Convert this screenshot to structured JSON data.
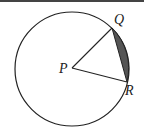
{
  "diagram": {
    "circle": {
      "cx": 72,
      "cy": 69,
      "r": 57,
      "stroke": "#222222"
    },
    "points": {
      "P": {
        "label": "P",
        "x": 72,
        "y": 68
      },
      "Q": {
        "label": "Q",
        "x": 112,
        "y": 28
      },
      "R": {
        "label": "R",
        "x": 127,
        "y": 82
      }
    },
    "segments": [
      "PQ",
      "PR",
      "QR"
    ],
    "shaded_region": {
      "description": "circular segment between chord QR and arc QR",
      "fill": "#555555"
    }
  }
}
